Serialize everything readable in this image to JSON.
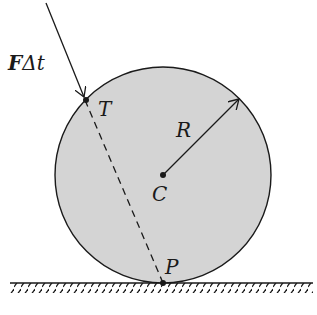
{
  "diagram": {
    "labels": {
      "impulse": "FΔt",
      "impulse_bold": "F",
      "impulse_rest": "Δt",
      "tangent_point": "T",
      "center": "C",
      "radius": "R",
      "contact_point": "P"
    },
    "colors": {
      "disk_fill": "#d4d4d4",
      "stroke": "#1a1a1a",
      "background": "#ffffff"
    },
    "geometry": {
      "center": [
        163,
        174
      ],
      "radius": 108,
      "ground_y": 283
    }
  }
}
